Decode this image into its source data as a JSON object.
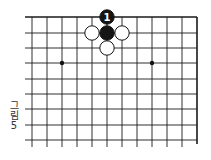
{
  "figure": {
    "caption_chars": [
      "그",
      "림",
      "5"
    ],
    "caption": "그림 5"
  },
  "board": {
    "columns_x": [
      32,
      47,
      62,
      77,
      92,
      107,
      122,
      137,
      152,
      167,
      182,
      197
    ],
    "rows_y": [
      17,
      33,
      48,
      63,
      79,
      94,
      109,
      125,
      140
    ],
    "h_line_start_x": 25,
    "v_line_end_y": 147,
    "edges": [
      "top",
      "right"
    ],
    "line_color": "#1a1a1a",
    "star_points": [
      {
        "col": 2,
        "row": 3
      },
      {
        "col": 8,
        "row": 3
      }
    ],
    "stones": [
      {
        "color": "black",
        "col": 5,
        "row": 0,
        "label": "1"
      },
      {
        "color": "black",
        "col": 5,
        "row": 1,
        "label": ""
      },
      {
        "color": "white",
        "col": 4,
        "row": 1,
        "label": ""
      },
      {
        "color": "white",
        "col": 6,
        "row": 1,
        "label": ""
      },
      {
        "color": "white",
        "col": 5,
        "row": 2,
        "label": ""
      }
    ]
  }
}
